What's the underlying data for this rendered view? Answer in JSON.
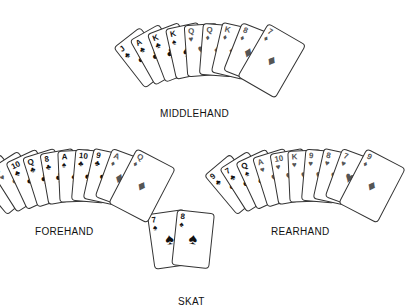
{
  "labels": {
    "middlehand": "MIDDLEHAND",
    "forehand": "FOREHAND",
    "rearhand": "REARHAND",
    "skat": "SKAT"
  },
  "hands": {
    "middlehand": {
      "cards": [
        {
          "rank": "J",
          "suit": "♣",
          "color": "black"
        },
        {
          "rank": "A",
          "suit": "♣",
          "color": "black"
        },
        {
          "rank": "K",
          "suit": "♣",
          "color": "black"
        },
        {
          "rank": "K",
          "suit": "♠",
          "color": "black"
        },
        {
          "rank": "Q",
          "suit": "♥",
          "color": "red"
        },
        {
          "rank": "Q",
          "suit": "♦",
          "color": "red"
        },
        {
          "rank": "K",
          "suit": "♦",
          "color": "red"
        },
        {
          "rank": "8",
          "suit": "♦",
          "color": "red"
        },
        {
          "rank": "7",
          "suit": "♦",
          "color": "red"
        }
      ]
    },
    "forehand": {
      "cards": [
        {
          "rank": "J",
          "suit": "♦",
          "color": "red"
        },
        {
          "rank": "J",
          "suit": "♥",
          "color": "red"
        },
        {
          "rank": "10",
          "suit": "♣",
          "color": "black"
        },
        {
          "rank": "Q",
          "suit": "♣",
          "color": "black"
        },
        {
          "rank": "8",
          "suit": "♣",
          "color": "black"
        },
        {
          "rank": "A",
          "suit": "♠",
          "color": "black"
        },
        {
          "rank": "10",
          "suit": "♣",
          "color": "black"
        },
        {
          "rank": "9",
          "suit": "♣",
          "color": "black"
        },
        {
          "rank": "A",
          "suit": "♦",
          "color": "red"
        },
        {
          "rank": "Q",
          "suit": "♦",
          "color": "red"
        }
      ]
    },
    "rearhand": {
      "cards": [
        {
          "rank": "9",
          "suit": "♣",
          "color": "black"
        },
        {
          "rank": "7",
          "suit": "♣",
          "color": "black"
        },
        {
          "rank": "Q",
          "suit": "♠",
          "color": "black"
        },
        {
          "rank": "A",
          "suit": "♥",
          "color": "red"
        },
        {
          "rank": "10",
          "suit": "♥",
          "color": "red"
        },
        {
          "rank": "K",
          "suit": "♥",
          "color": "red"
        },
        {
          "rank": "9",
          "suit": "♥",
          "color": "red"
        },
        {
          "rank": "8",
          "suit": "♥",
          "color": "red"
        },
        {
          "rank": "7",
          "suit": "♥",
          "color": "red"
        },
        {
          "rank": "9",
          "suit": "♦",
          "color": "red"
        }
      ]
    },
    "skat": {
      "cards": [
        {
          "rank": "7",
          "suit": "♠",
          "color": "black"
        },
        {
          "rank": "8",
          "suit": "♠",
          "color": "black"
        }
      ]
    }
  }
}
